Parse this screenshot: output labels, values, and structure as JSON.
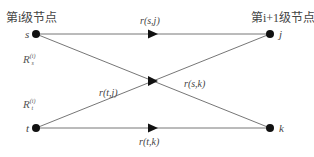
{
  "diagram": {
    "headers": {
      "left": "第i级节点",
      "right": "第i+1级节点"
    },
    "nodes": [
      {
        "id": "s",
        "label": "s",
        "x": 36,
        "y": 34
      },
      {
        "id": "t",
        "label": "t",
        "x": 36,
        "y": 128
      },
      {
        "id": "j",
        "label": "j",
        "x": 270,
        "y": 34
      },
      {
        "id": "k",
        "label": "k",
        "x": 270,
        "y": 128
      }
    ],
    "edges": [
      {
        "from": "s",
        "to": "j",
        "label": "r(s,j)"
      },
      {
        "from": "s",
        "to": "k",
        "label": "r(s,k)"
      },
      {
        "from": "t",
        "to": "j",
        "label": "r(t,j)"
      },
      {
        "from": "t",
        "to": "k",
        "label": "r(t,k)"
      }
    ],
    "resource_labels": {
      "s": {
        "base": "R",
        "sub": "s",
        "sup": "(i)"
      },
      "t": {
        "base": "R",
        "sub": "t",
        "sup": "(i)"
      }
    },
    "colors": {
      "line": "#555555",
      "node": "#111111",
      "arrow": "#111111"
    }
  }
}
